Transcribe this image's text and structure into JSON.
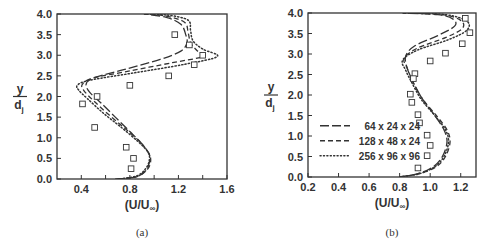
{
  "chart_data": [
    {
      "type": "line",
      "panel": "a",
      "caption": "(a)",
      "xlabel": "(U/U∞)",
      "ylabel_num": "y",
      "ylabel_den": "dj",
      "xlim": [
        0.2,
        1.6
      ],
      "ylim": [
        0.0,
        4.0
      ],
      "xticks": [
        0.4,
        0.8,
        1.2,
        1.6
      ],
      "xtick_labels": [
        "0.4",
        "0.8",
        "1.2",
        "1.6"
      ],
      "xminor": [
        0.6,
        1.0,
        1.4
      ],
      "yticks": [
        0.0,
        0.5,
        1.0,
        1.5,
        2.0,
        2.5,
        3.0,
        3.5,
        4.0
      ],
      "ytick_labels": [
        "0.0",
        "0.5",
        "1.0",
        "1.5",
        "2.0",
        "2.5",
        "3.0",
        "3.5",
        "4.0"
      ],
      "grid": false,
      "legend": null,
      "series": [
        {
          "name": "64 x 24 x 24",
          "style": "longdash",
          "points": [
            [
              0.68,
              0
            ],
            [
              0.85,
              0.05
            ],
            [
              0.93,
              0.2
            ],
            [
              0.96,
              0.4
            ],
            [
              0.96,
              0.6
            ],
            [
              0.9,
              0.85
            ],
            [
              0.8,
              1.15
            ],
            [
              0.68,
              1.5
            ],
            [
              0.56,
              1.85
            ],
            [
              0.47,
              2.1
            ],
            [
              0.44,
              2.3
            ],
            [
              0.5,
              2.45
            ],
            [
              0.75,
              2.65
            ],
            [
              1.05,
              2.9
            ],
            [
              1.22,
              3.1
            ],
            [
              1.27,
              3.3
            ],
            [
              1.26,
              3.5
            ],
            [
              1.22,
              3.75
            ],
            [
              1.1,
              3.92
            ],
            [
              0.92,
              4.0
            ]
          ]
        },
        {
          "name": "128 x 48 x 24",
          "style": "dash",
          "points": [
            [
              0.7,
              0
            ],
            [
              0.86,
              0.06
            ],
            [
              0.94,
              0.22
            ],
            [
              0.97,
              0.4
            ],
            [
              0.96,
              0.6
            ],
            [
              0.89,
              0.88
            ],
            [
              0.77,
              1.2
            ],
            [
              0.63,
              1.55
            ],
            [
              0.5,
              1.9
            ],
            [
              0.42,
              2.15
            ],
            [
              0.41,
              2.3
            ],
            [
              0.5,
              2.45
            ],
            [
              0.8,
              2.62
            ],
            [
              1.15,
              2.82
            ],
            [
              1.4,
              2.97
            ],
            [
              1.35,
              3.12
            ],
            [
              1.3,
              3.3
            ],
            [
              1.28,
              3.55
            ],
            [
              1.25,
              3.8
            ],
            [
              1.1,
              3.95
            ],
            [
              0.92,
              4.0
            ]
          ]
        },
        {
          "name": "256 x 96 x 96",
          "style": "dot",
          "points": [
            [
              0.72,
              0
            ],
            [
              0.86,
              0.08
            ],
            [
              0.93,
              0.25
            ],
            [
              0.96,
              0.45
            ],
            [
              0.95,
              0.65
            ],
            [
              0.87,
              0.9
            ],
            [
              0.73,
              1.25
            ],
            [
              0.58,
              1.6
            ],
            [
              0.45,
              1.95
            ],
            [
              0.38,
              2.15
            ],
            [
              0.37,
              2.28
            ],
            [
              0.48,
              2.4
            ],
            [
              0.85,
              2.58
            ],
            [
              1.25,
              2.78
            ],
            [
              1.52,
              2.97
            ],
            [
              1.4,
              3.15
            ],
            [
              1.32,
              3.35
            ],
            [
              1.3,
              3.6
            ],
            [
              1.28,
              3.85
            ],
            [
              1.12,
              3.97
            ],
            [
              0.92,
              4.0
            ]
          ]
        }
      ],
      "markers": {
        "name": "experiment",
        "symbol": "open-square",
        "points": [
          [
            1.17,
            3.5
          ],
          [
            1.29,
            3.25
          ],
          [
            1.4,
            3.0
          ],
          [
            1.33,
            2.77
          ],
          [
            1.12,
            2.5
          ],
          [
            0.8,
            2.27
          ],
          [
            0.53,
            2.0
          ],
          [
            0.41,
            1.82
          ],
          [
            0.51,
            1.25
          ],
          [
            0.77,
            0.77
          ],
          [
            0.83,
            0.5
          ],
          [
            0.81,
            0.25
          ]
        ]
      }
    },
    {
      "type": "line",
      "panel": "b",
      "caption": "(b)",
      "xlabel": "(U/U∞)",
      "ylabel_num": "y",
      "ylabel_den": "dj",
      "xlim": [
        0.2,
        1.3
      ],
      "ylim": [
        0.0,
        4.0
      ],
      "xticks": [
        0.2,
        0.4,
        0.6,
        0.8,
        1.0,
        1.2
      ],
      "xtick_labels": [
        "0.2",
        "0.4",
        "0.6",
        "0.8",
        "1.0",
        "1.2"
      ],
      "xminor": [],
      "yticks": [
        0.0,
        0.5,
        1.0,
        1.5,
        2.0,
        2.5,
        3.0,
        3.5,
        4.0
      ],
      "ytick_labels": [
        "0.0",
        "0.5",
        "1.0",
        "1.5",
        "2.0",
        "2.5",
        "3.0",
        "3.5",
        "4.0"
      ],
      "grid": false,
      "legend": {
        "position": "lower-left",
        "entries": [
          {
            "label": "64 x 24 x 24",
            "style": "longdash"
          },
          {
            "label": "128 x 48 x 24",
            "style": "dash"
          },
          {
            "label": "256 x 96 x 96",
            "style": "dot"
          }
        ]
      },
      "series": [
        {
          "name": "64 x 24 x 24",
          "style": "longdash",
          "points": [
            [
              0.8,
              0
            ],
            [
              0.92,
              0.08
            ],
            [
              1.02,
              0.25
            ],
            [
              1.08,
              0.5
            ],
            [
              1.11,
              0.85
            ],
            [
              1.09,
              1.15
            ],
            [
              1.03,
              1.5
            ],
            [
              0.95,
              1.9
            ],
            [
              0.89,
              2.3
            ],
            [
              0.85,
              2.65
            ],
            [
              0.84,
              2.95
            ],
            [
              0.9,
              3.2
            ],
            [
              1.05,
              3.45
            ],
            [
              1.16,
              3.68
            ],
            [
              1.15,
              3.85
            ],
            [
              1.05,
              3.96
            ],
            [
              0.82,
              4.0
            ]
          ]
        },
        {
          "name": "128 x 48 x 24",
          "style": "dash",
          "points": [
            [
              0.8,
              0
            ],
            [
              0.93,
              0.08
            ],
            [
              1.04,
              0.25
            ],
            [
              1.1,
              0.5
            ],
            [
              1.13,
              0.85
            ],
            [
              1.11,
              1.15
            ],
            [
              1.04,
              1.5
            ],
            [
              0.95,
              1.9
            ],
            [
              0.89,
              2.3
            ],
            [
              0.85,
              2.65
            ],
            [
              0.83,
              2.9
            ],
            [
              0.92,
              3.15
            ],
            [
              1.1,
              3.4
            ],
            [
              1.21,
              3.62
            ],
            [
              1.2,
              3.82
            ],
            [
              1.08,
              3.96
            ],
            [
              0.82,
              4.0
            ]
          ]
        },
        {
          "name": "256 x 96 x 96",
          "style": "dot",
          "points": [
            [
              0.8,
              0
            ],
            [
              0.93,
              0.08
            ],
            [
              1.03,
              0.25
            ],
            [
              1.09,
              0.5
            ],
            [
              1.12,
              0.85
            ],
            [
              1.1,
              1.15
            ],
            [
              1.03,
              1.5
            ],
            [
              0.94,
              1.9
            ],
            [
              0.88,
              2.3
            ],
            [
              0.84,
              2.6
            ],
            [
              0.82,
              2.85
            ],
            [
              0.92,
              3.1
            ],
            [
              1.12,
              3.35
            ],
            [
              1.24,
              3.58
            ],
            [
              1.24,
              3.8
            ],
            [
              1.1,
              3.96
            ],
            [
              0.82,
              4.0
            ]
          ]
        }
      ],
      "markers": {
        "name": "experiment",
        "symbol": "open-square",
        "points": [
          [
            1.23,
            3.87
          ],
          [
            1.26,
            3.52
          ],
          [
            1.21,
            3.25
          ],
          [
            1.1,
            3.02
          ],
          [
            1.0,
            2.83
          ],
          [
            0.9,
            2.52
          ],
          [
            0.89,
            2.4
          ],
          [
            0.87,
            2.02
          ],
          [
            0.88,
            1.82
          ],
          [
            0.92,
            1.52
          ],
          [
            0.93,
            1.32
          ],
          [
            0.98,
            1.02
          ],
          [
            1.0,
            0.77
          ],
          [
            0.98,
            0.52
          ],
          [
            0.92,
            0.22
          ]
        ]
      }
    }
  ],
  "layout": {
    "panels": [
      {
        "left": 57,
        "top": 14,
        "right": 227,
        "bottom": 179,
        "caption_y": 236
      },
      {
        "left": 308,
        "top": 13,
        "right": 476,
        "bottom": 177,
        "caption_y": 236
      }
    ],
    "ink": "#333333"
  }
}
